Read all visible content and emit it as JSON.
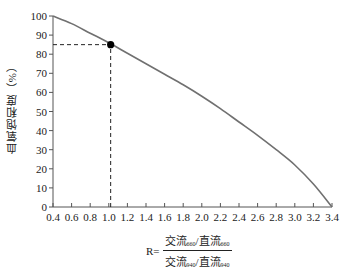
{
  "chart_data": {
    "type": "line",
    "title": "",
    "xlabel": "R= (交流660/直流660)/(交流940/直流940)",
    "ylabel": "血氧饱和度（%）",
    "xlim": [
      0.4,
      3.4
    ],
    "ylim": [
      0,
      100
    ],
    "grid": false,
    "legend": null,
    "x_ticks": [
      "0.4",
      "0.6",
      "0.8",
      "1.0",
      "1.2",
      "1.4",
      "1.6",
      "1.8",
      "2.0",
      "2.2",
      "2.4",
      "2.6",
      "2.8",
      "3.0",
      "3.2",
      "3.4"
    ],
    "y_ticks": [
      "0",
      "10",
      "20",
      "30",
      "40",
      "50",
      "60",
      "70",
      "80",
      "90",
      "100"
    ],
    "series": [
      {
        "name": "SpO2 calibration curve",
        "color": "#707070",
        "x": [
          0.4,
          0.6,
          0.8,
          1.0,
          1.2,
          1.4,
          1.6,
          1.8,
          2.0,
          2.2,
          2.4,
          2.6,
          2.8,
          3.0,
          3.2,
          3.4
        ],
        "y": [
          100,
          96,
          91,
          86,
          80.5,
          75,
          69.5,
          64,
          58,
          51.5,
          44.5,
          37.5,
          30,
          22,
          12,
          0
        ]
      }
    ],
    "annotations": [
      {
        "type": "point",
        "x": 1.02,
        "y": 85,
        "color": "#000000"
      },
      {
        "type": "dashed-guide",
        "from": [
          0.4,
          85
        ],
        "to": [
          1.02,
          85
        ]
      },
      {
        "type": "dashed-guide",
        "from": [
          1.02,
          0
        ],
        "to": [
          1.02,
          85
        ]
      }
    ]
  },
  "labels": {
    "ylabel": "血氧饱和度（%）",
    "formula_prefix": "R=",
    "num_a": "交流",
    "num_a_sub": "660",
    "num_sep": "/直流",
    "num_b_sub": "660",
    "den_a": "交流",
    "den_a_sub": "940",
    "den_sep": "/直流",
    "den_b_sub": "940"
  }
}
